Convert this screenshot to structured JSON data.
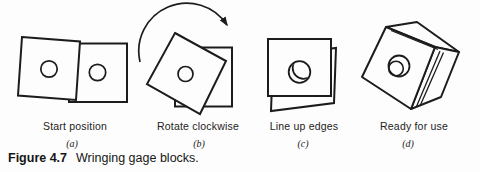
{
  "figure": {
    "caption_label": "Figure 4.7",
    "caption_text": "Wringing gage blocks.",
    "panels": [
      {
        "label": "Start position",
        "tag": "(a)"
      },
      {
        "label": "Rotate clockwise",
        "tag": "(b)"
      },
      {
        "label": "Line up edges",
        "tag": "(c)"
      },
      {
        "label": "Ready for use",
        "tag": "(d)"
      }
    ],
    "icons": [
      {
        "name": "rotate-clockwise-arrow-icon",
        "meaning": "curved arrow indicating clockwise rotation"
      }
    ],
    "colors": {
      "ink": "#1c1c1c",
      "paper": "#fdfdfd"
    }
  }
}
